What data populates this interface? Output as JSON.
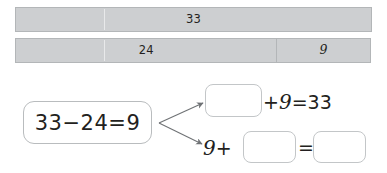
{
  "bar_model": {
    "name": "part-whole-bar-model",
    "whole_row": {
      "cells": [
        {
          "label": "33",
          "width_percent": 100,
          "role": "whole"
        }
      ]
    },
    "parts_row": {
      "cells": [
        {
          "label": "24",
          "width_percent": 73.5,
          "role": "known-part"
        },
        {
          "label": "9",
          "width_percent": 26.5,
          "role": "other-part"
        }
      ]
    },
    "fill_color": "#cdcfd1",
    "border_color": "#b3b6b8"
  },
  "work_area": {
    "source_equation": "33−24=9",
    "arrow_count": 2,
    "derived_equations": [
      {
        "id": "addition-missing-addend",
        "parts": [
          "",
          "+",
          "9",
          "=",
          "33"
        ],
        "text_after_blank": "+9=33",
        "blank_label": ""
      },
      {
        "id": "addition-commuted",
        "parts": [
          "9",
          "+",
          "",
          "=",
          ""
        ],
        "text_before_blank": "9+",
        "text_between_blanks": "=",
        "blank_label": ""
      }
    ],
    "blank_color": "#ffffff",
    "blank_border_color": "#c3c6c8"
  }
}
